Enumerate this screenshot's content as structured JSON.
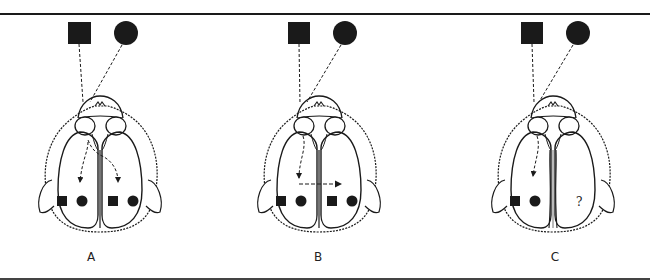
{
  "figure": {
    "panels": [
      {
        "id": "A",
        "label": "A",
        "label_x": 91,
        "offset_x": 0,
        "mode": "bilateral-split"
      },
      {
        "id": "B",
        "label": "B",
        "label_x": 318,
        "offset_x": 220,
        "mode": "ipsilateral-transfer"
      },
      {
        "id": "C",
        "label": "C",
        "label_x": 555,
        "offset_x": 453,
        "mode": "split-chiasm-commissure"
      }
    ],
    "stimuli": {
      "square": "filled-square",
      "circle": "filled-circle"
    },
    "unknown_marker": "?",
    "colors": {
      "ink": "#1a1a1a",
      "background": "#ffffff"
    }
  }
}
